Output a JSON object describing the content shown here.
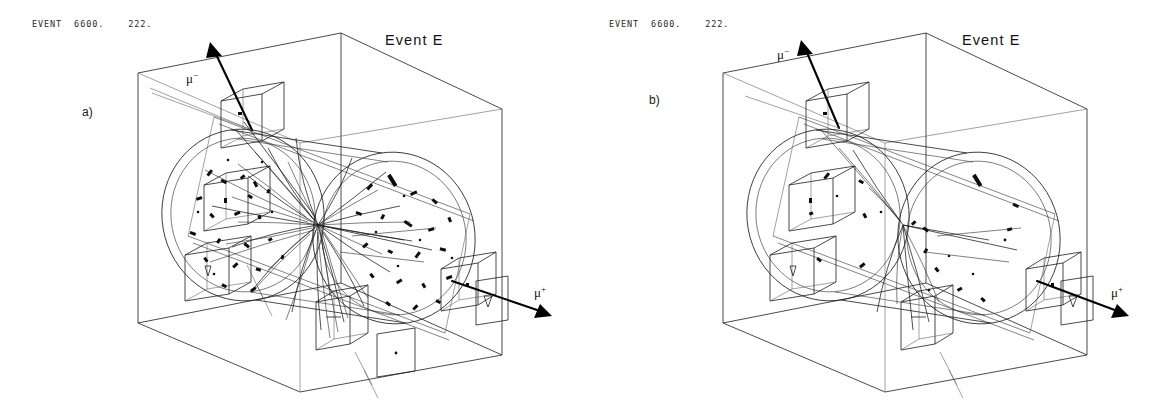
{
  "figure": {
    "background_color": "#ffffff",
    "ink_color": "#1d1d1d",
    "caption_font_note": "monospace printer header"
  },
  "panels": [
    {
      "id": "a",
      "letter": "a)",
      "header": "EVENT  6600.    222.",
      "title": "Event E",
      "labels": {
        "muon_negative": "μ",
        "muon_negative_charge": "−",
        "muon_positive": "μ",
        "muon_positive_charge": "+"
      },
      "description": "All reconstructed tracks shown",
      "track_count": 38,
      "hit_count": 62
    },
    {
      "id": "b",
      "letter": "b)",
      "header": "EVENT  6600.    222.",
      "title": "Event E",
      "labels": {
        "muon_negative": "μ",
        "muon_negative_charge": "−",
        "muon_positive": "μ",
        "muon_positive_charge": "+"
      },
      "description": "Selected tracks only",
      "track_count": 9,
      "hit_count": 24
    }
  ],
  "detector": {
    "outer_box_label": "bounding volume",
    "cylinder_label": "central tracking cylinder",
    "muon_chambers": [
      "top-chamber",
      "left-upper-chamber",
      "left-lower-chamber",
      "bottom-center-chamber",
      "right-chamber",
      "right-panel",
      "bottom-right-panel"
    ]
  }
}
